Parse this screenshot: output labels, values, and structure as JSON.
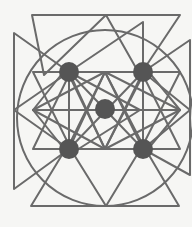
{
  "diagram": {
    "colors": {
      "background": "#f6f6f4",
      "stroke": "#6a6a6a",
      "dot": "#555555"
    },
    "stroke_width": 2,
    "center": [
      105,
      110
    ],
    "circle": {
      "cx": 105,
      "cy": 118,
      "r": 88
    },
    "dots": [
      {
        "name": "top-left",
        "cx": 69,
        "cy": 72,
        "r": 10
      },
      {
        "name": "top-right",
        "cx": 143,
        "cy": 72,
        "r": 10
      },
      {
        "name": "center",
        "cx": 105,
        "cy": 109,
        "r": 10
      },
      {
        "name": "bottom-left",
        "cx": 69,
        "cy": 149,
        "r": 10
      },
      {
        "name": "bottom-right",
        "cx": 143,
        "cy": 149,
        "r": 10
      }
    ],
    "outer_triangles": [
      {
        "name": "top-left",
        "points": [
          [
            32,
            15
          ],
          [
            106,
            15
          ],
          [
            44,
            75
          ]
        ]
      },
      {
        "name": "top-right",
        "points": [
          [
            106,
            15
          ],
          [
            180,
            15
          ],
          [
            140,
            75
          ]
        ]
      },
      {
        "name": "bottom-left",
        "points": [
          [
            31,
            206
          ],
          [
            106,
            206
          ],
          [
            68,
            145
          ]
        ]
      },
      {
        "name": "bottom-right",
        "points": [
          [
            106,
            206
          ],
          [
            179,
            206
          ],
          [
            143,
            145
          ]
        ]
      },
      {
        "name": "left-top",
        "points": [
          [
            14,
            33
          ],
          [
            14,
            110
          ],
          [
            69,
            72
          ]
        ]
      },
      {
        "name": "left-bottom",
        "points": [
          [
            14,
            110
          ],
          [
            14,
            189
          ],
          [
            69,
            149
          ]
        ]
      },
      {
        "name": "right-top",
        "points": [
          [
            190,
            40
          ],
          [
            143,
            72
          ],
          [
            190,
            110
          ]
        ]
      },
      {
        "name": "right-bottom",
        "points": [
          [
            190,
            110
          ],
          [
            143,
            149
          ],
          [
            190,
            175
          ]
        ]
      }
    ],
    "inner_triangles": [
      {
        "name": "inner-top-left",
        "points": [
          [
            69,
            72
          ],
          [
            69,
            155
          ],
          [
            140,
            110
          ]
        ]
      },
      {
        "name": "inner-top",
        "points": [
          [
            143,
            22
          ],
          [
            69,
            72
          ],
          [
            143,
            72
          ]
        ]
      },
      {
        "name": "inner-up",
        "points": [
          [
            105,
            72
          ],
          [
            33,
            110
          ],
          [
            180,
            110
          ]
        ]
      },
      {
        "name": "inner-down",
        "points": [
          [
            105,
            149
          ],
          [
            33,
            110
          ],
          [
            180,
            110
          ]
        ]
      },
      {
        "name": "inner-left",
        "points": [
          [
            69,
            65
          ],
          [
            69,
            155
          ],
          [
            33,
            110
          ]
        ]
      },
      {
        "name": "inner-right",
        "points": [
          [
            143,
            65
          ],
          [
            143,
            155
          ],
          [
            180,
            110
          ]
        ]
      },
      {
        "name": "inner-tl-down",
        "points": [
          [
            33,
            72
          ],
          [
            105,
            72
          ],
          [
            69,
            145
          ]
        ]
      },
      {
        "name": "inner-tr-down",
        "points": [
          [
            105,
            72
          ],
          [
            180,
            72
          ],
          [
            143,
            145
          ]
        ]
      },
      {
        "name": "inner-bl-up",
        "points": [
          [
            33,
            149
          ],
          [
            105,
            149
          ],
          [
            69,
            75
          ]
        ]
      },
      {
        "name": "inner-br-up",
        "points": [
          [
            105,
            149
          ],
          [
            180,
            149
          ],
          [
            143,
            75
          ]
        ]
      }
    ],
    "spokes": [
      [
        [
          69,
          72
        ],
        [
          143,
          149
        ]
      ],
      [
        [
          143,
          72
        ],
        [
          69,
          149
        ]
      ],
      [
        [
          105,
          72
        ],
        [
          69,
          149
        ]
      ],
      [
        [
          105,
          72
        ],
        [
          143,
          149
        ]
      ],
      [
        [
          105,
          149
        ],
        [
          69,
          72
        ]
      ],
      [
        [
          105,
          149
        ],
        [
          143,
          72
        ]
      ]
    ]
  }
}
